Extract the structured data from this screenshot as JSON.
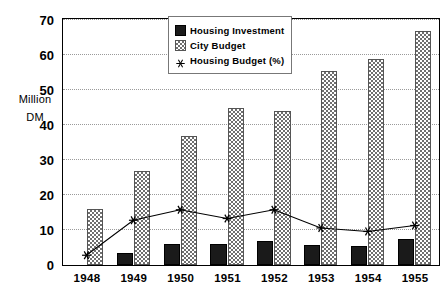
{
  "chart_data": {
    "type": "bar",
    "title": "",
    "subtitle": "",
    "xlabel": "",
    "ylabel": "Million DM",
    "ylabel_lines": [
      "Million",
      "DM"
    ],
    "categories": [
      "1948",
      "1949",
      "1950",
      "1951",
      "1952",
      "1953",
      "1954",
      "1955"
    ],
    "ylim": [
      0,
      70
    ],
    "ytick_step": 10,
    "yticks": [
      "0",
      "10",
      "20",
      "30",
      "40",
      "50",
      "60",
      "70"
    ],
    "grid": true,
    "legend_position": "top-center",
    "series": [
      {
        "name": "Housing Investment",
        "type": "bar",
        "marker": "filled-square",
        "color": "#1a1a1a",
        "values": [
          0,
          3.5,
          6,
          6,
          7,
          5.8,
          5.5,
          7.5
        ]
      },
      {
        "name": "City Budget",
        "type": "bar",
        "marker": "checkered-square",
        "color": "#6f6f6f",
        "values": [
          16,
          27,
          37,
          45,
          44,
          55.5,
          59,
          67
        ]
      },
      {
        "name": "Housing Budget (%)",
        "type": "line",
        "marker": "asterisk",
        "color": "#000000",
        "values": [
          2.5,
          12.5,
          15.5,
          13,
          15.5,
          10.3,
          9.3,
          11
        ]
      }
    ]
  },
  "legend": {
    "items": [
      {
        "label": "Housing Investment",
        "key": "filled-square-icon"
      },
      {
        "label": "City Budget",
        "key": "checkered-square-icon"
      },
      {
        "label": "Housing Budget (%)",
        "key": "asterisk-icon"
      }
    ]
  }
}
